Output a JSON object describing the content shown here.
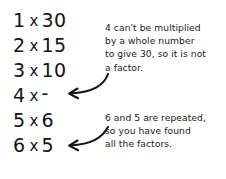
{
  "worksheet": {
    "title": "Factor pairs of 30 with explanation notes",
    "ink_color": "#141414",
    "background_color": "#ffffff"
  },
  "factor_list": {
    "rows": [
      {
        "a": "1",
        "operator": "x",
        "b": "30"
      },
      {
        "a": "2",
        "operator": "x",
        "b": "15"
      },
      {
        "a": "3",
        "operator": "x",
        "b": "10"
      },
      {
        "a": "4",
        "operator": "x",
        "b": "-"
      },
      {
        "a": "5",
        "operator": "x",
        "b": "6"
      },
      {
        "a": "6",
        "operator": "x",
        "b": "5"
      }
    ]
  },
  "callouts": {
    "factor_note": {
      "lines": [
        "4 can't be multiplied",
        "by a whole number",
        "to give 30, so it is not",
        "a factor."
      ]
    },
    "repeat_note": {
      "lines": [
        "6 and 5 are repeated,",
        "so you have found",
        "all the factors."
      ]
    }
  },
  "arrows": {
    "to_four_row": {
      "icon": "curved-arrow-left-icon"
    },
    "to_six_five_row": {
      "icon": "curved-arrow-left-icon"
    }
  }
}
